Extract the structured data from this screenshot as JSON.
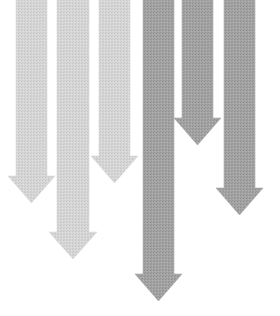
{
  "image": {
    "description": "Six downward-pointing arrows of varying lengths in two shades of gray",
    "tones": {
      "light": "#d3d3d3",
      "dark": "#9f9f9f",
      "background": "#ffffff"
    }
  },
  "arrows": [
    {
      "id": "arrow-1",
      "direction": "down",
      "tone": "light",
      "relative_length": 0.67
    },
    {
      "id": "arrow-2",
      "direction": "down",
      "tone": "light",
      "relative_length": 0.86
    },
    {
      "id": "arrow-3",
      "direction": "down",
      "tone": "light",
      "relative_length": 0.61
    },
    {
      "id": "arrow-4",
      "direction": "down",
      "tone": "dark",
      "relative_length": 1.0
    },
    {
      "id": "arrow-5",
      "direction": "down",
      "tone": "dark",
      "relative_length": 0.48
    },
    {
      "id": "arrow-6",
      "direction": "down",
      "tone": "dark",
      "relative_length": 0.71
    }
  ]
}
